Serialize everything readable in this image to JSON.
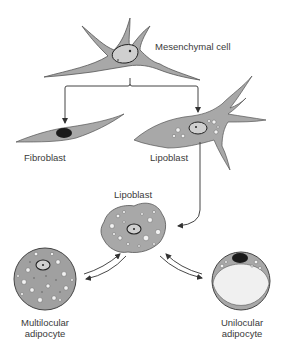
{
  "diagram": {
    "colors": {
      "cytoplasm": "#a8a8a8",
      "outline": "#555555",
      "nucleus_light": "#cfcfcf",
      "nucleus_dark": "#1a1a1a",
      "lipid": "#f2f2f2",
      "arrow": "#333333",
      "text": "#3a3a3a"
    },
    "nodes": {
      "mesenchymal": {
        "label": "Mesenchymal cell"
      },
      "fibroblast": {
        "label": "Fibroblast"
      },
      "lipoblast_early": {
        "label": "Lipoblast"
      },
      "lipoblast": {
        "label": "Lipoblast"
      },
      "multilocular": {
        "label_line1": "Multilocular",
        "label_line2": "adipocyte"
      },
      "unilocular": {
        "label_line1": "Unilocular",
        "label_line2": "adipocyte"
      }
    },
    "edges": [
      {
        "from": "Mesenchymal cell",
        "to": "Fibroblast"
      },
      {
        "from": "Mesenchymal cell",
        "to": "Lipoblast"
      },
      {
        "from": "Lipoblast",
        "to": "Lipoblast"
      },
      {
        "from": "Lipoblast",
        "to": "Multilocular adipocyte",
        "bidirectional": true
      },
      {
        "from": "Lipoblast",
        "to": "Unilocular adipocyte",
        "bidirectional": true
      }
    ]
  }
}
